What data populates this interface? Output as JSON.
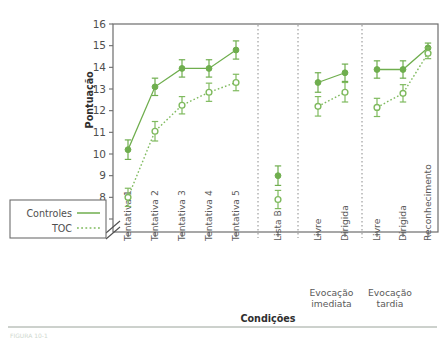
{
  "figure": {
    "caption_faint": "FIGURA 10-1"
  },
  "legend": {
    "position": "left-outside",
    "items": [
      {
        "label": "Controles",
        "style": "solid",
        "marker": "filled-circle"
      },
      {
        "label": "TOC",
        "style": "dotted",
        "marker": "open-circle"
      }
    ]
  },
  "chart_data": {
    "type": "line",
    "title": "",
    "xlabel": "Condições",
    "ylabel": "Pontuação",
    "ylim": [
      7,
      16
    ],
    "yticks": [
      7,
      8,
      9,
      10,
      11,
      12,
      13,
      14,
      15,
      16
    ],
    "ytick_labels": [
      "7",
      "8",
      "9",
      "10",
      "11",
      "12",
      "13",
      "14",
      "15",
      "16"
    ],
    "axis_break": true,
    "grid": false,
    "legend_position": "left-outside",
    "colors": {
      "controles": "#6fae4e",
      "toc": "#7fba5e",
      "axis": "#6d6d6d",
      "text": "#4f4f4f"
    },
    "categories": [
      "Tentativa 1",
      "Tentativa 2",
      "Tentativa 3",
      "Tentativa 4",
      "Tentativa 5",
      "Lista B",
      "Livre",
      "Dirigida",
      "Livre",
      "Dirigida",
      "Reconhecimento"
    ],
    "groups": [
      {
        "label": "",
        "categories": [
          "Tentativa 1",
          "Tentativa 2",
          "Tentativa 3",
          "Tentativa 4",
          "Tentativa 5"
        ]
      },
      {
        "label": "",
        "categories": [
          "Lista B"
        ]
      },
      {
        "label": "Evocação imediata",
        "categories": [
          "Livre",
          "Dirigida"
        ]
      },
      {
        "label": "Evocação tardia",
        "categories": [
          "Livre",
          "Dirigida"
        ]
      },
      {
        "label": "",
        "categories": [
          "Reconhecimento"
        ]
      }
    ],
    "group_labels": [
      "Evocação imediata",
      "Evocação tardia"
    ],
    "separators": [
      5,
      6,
      8
    ],
    "series": [
      {
        "name": "Controles",
        "style": "solid",
        "marker": "filled-circle",
        "values": [
          10.2,
          13.1,
          13.95,
          13.95,
          14.8,
          9.0,
          13.3,
          13.75,
          13.9,
          13.9,
          14.9
        ],
        "errors": [
          0.45,
          0.4,
          0.4,
          0.4,
          0.42,
          0.45,
          0.45,
          0.4,
          0.4,
          0.4,
          0.22
        ]
      },
      {
        "name": "TOC",
        "style": "dotted",
        "marker": "open-circle",
        "values": [
          8.0,
          11.05,
          12.25,
          12.85,
          13.3,
          7.9,
          12.2,
          12.85,
          12.15,
          12.8,
          14.65
        ],
        "errors": [
          0.42,
          0.45,
          0.4,
          0.42,
          0.38,
          0.42,
          0.45,
          0.45,
          0.42,
          0.4,
          0.25
        ]
      }
    ]
  }
}
